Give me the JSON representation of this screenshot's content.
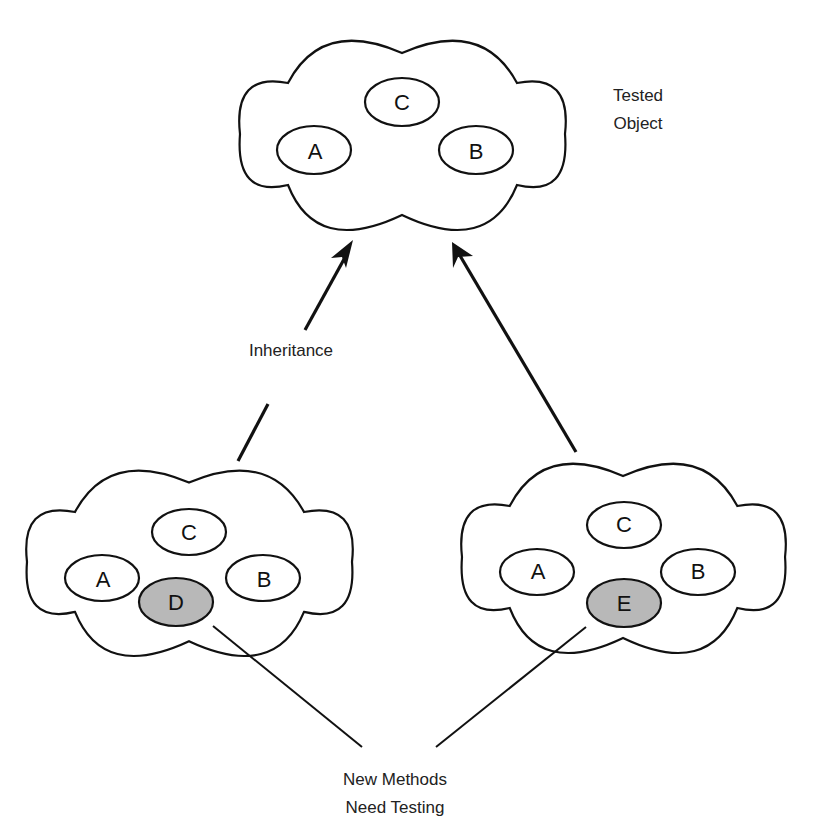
{
  "diagram": {
    "top_object": {
      "label": "Tested Object",
      "label_line1": "Tested",
      "label_line2": "Object",
      "methods": [
        {
          "name": "A",
          "highlighted": false
        },
        {
          "name": "B",
          "highlighted": false
        },
        {
          "name": "C",
          "highlighted": false
        }
      ]
    },
    "subclass_left": {
      "methods": [
        {
          "name": "A",
          "highlighted": false
        },
        {
          "name": "B",
          "highlighted": false
        },
        {
          "name": "C",
          "highlighted": false
        },
        {
          "name": "D",
          "highlighted": true
        }
      ]
    },
    "subclass_right": {
      "methods": [
        {
          "name": "A",
          "highlighted": false
        },
        {
          "name": "B",
          "highlighted": false
        },
        {
          "name": "C",
          "highlighted": false
        },
        {
          "name": "E",
          "highlighted": true
        }
      ]
    },
    "relation_label": "Inheritance",
    "callout": {
      "line1": "New Methods",
      "line2": "Need Testing"
    },
    "colors": {
      "stroke": "#111111",
      "new_method_fill": "#b8b8b8",
      "background": "#ffffff"
    }
  }
}
